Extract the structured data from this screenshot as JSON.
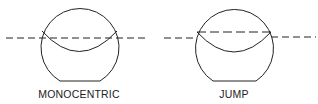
{
  "figures": [
    {
      "id": "monocentric",
      "label": "MONOCENTRIC"
    },
    {
      "id": "jump",
      "label": "JUMP"
    }
  ],
  "colors": {
    "stroke": "#222222",
    "background": "#ffffff"
  }
}
